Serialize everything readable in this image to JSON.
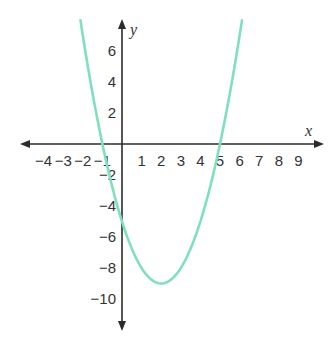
{
  "chart_data": {
    "type": "line",
    "title": "",
    "xlabel": "x",
    "ylabel": "y",
    "function": "y = x^2 - 4x - 5",
    "x_ticks": [
      -4,
      -3,
      -2,
      -1,
      1,
      2,
      3,
      4,
      5,
      6,
      7,
      8,
      9
    ],
    "y_ticks": [
      6,
      4,
      2,
      -2,
      -4,
      -6,
      -8,
      -10
    ],
    "x_tick_labels": [
      "−4",
      "−3",
      "−2",
      "−1",
      "1",
      "2",
      "3",
      "4",
      "5",
      "6",
      "7",
      "8",
      "9"
    ],
    "y_tick_labels": [
      "6",
      "4",
      "2",
      "−2",
      "−4",
      "−6",
      "−8",
      "−10"
    ],
    "xlim": [
      -5,
      10
    ],
    "ylim": [
      -12,
      8
    ],
    "grid": false,
    "legend": null,
    "key_points": {
      "vertex": [
        2,
        -9
      ],
      "x_intercepts": [
        -1,
        5
      ],
      "y_intercept": -5
    },
    "series": [
      {
        "name": "parabola",
        "color": "#7fe0be",
        "x": [
          -2.1,
          -1,
          0,
          1,
          2,
          3,
          4,
          5,
          6.1
        ],
        "y": [
          7.8,
          0,
          -5,
          -8,
          -9,
          -8,
          -5,
          0,
          7.4
        ]
      }
    ]
  },
  "colors": {
    "axis": "#2b2b2b",
    "curve": "#7fe0be",
    "text": "#333333"
  }
}
